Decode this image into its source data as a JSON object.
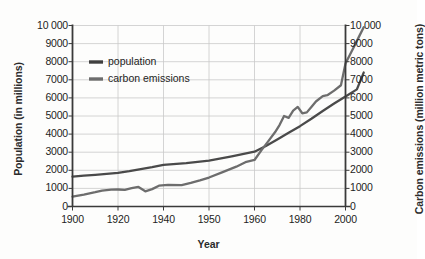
{
  "chart_data": {
    "type": "line",
    "title": "",
    "xlabel": "Year",
    "ylabel": "Population (in millions)",
    "ylabel_right": "Carbon emissions (million metric tons)",
    "xlim": [
      1900,
      2008
    ],
    "ylim": [
      0,
      10000
    ],
    "ylim_right": [
      0,
      10000
    ],
    "grid": true,
    "legend_position": "upper-left-inside",
    "y_ticks": [
      "0",
      "1000",
      "2000",
      "3000",
      "4000",
      "5000",
      "6000",
      "7000",
      "8000",
      "9000",
      "10 000"
    ],
    "y_tick_values": [
      0,
      1000,
      2000,
      3000,
      4000,
      5000,
      6000,
      7000,
      8000,
      9000,
      10000
    ],
    "y_ticks_right": [
      "0",
      "1000",
      "2000",
      "3000",
      "4000",
      "5000",
      "6000",
      "7000",
      "8000",
      "9000",
      "10 000"
    ],
    "x_ticks": [
      "1900",
      "1920",
      "1940",
      "1950",
      "1960",
      "1980",
      "2000"
    ],
    "x_tick_values": [
      1900,
      1920,
      1940,
      1950,
      1960,
      1980,
      2000
    ],
    "series": [
      {
        "name": "population",
        "axis": "left",
        "color": "#4a4a4a",
        "x": [
          1900,
          1905,
          1910,
          1915,
          1920,
          1925,
          1930,
          1935,
          1940,
          1945,
          1950,
          1955,
          1960,
          1965,
          1970,
          1975,
          1980,
          1985,
          1990,
          1995,
          2000,
          2005,
          2008
        ],
        "values": [
          1650,
          1710,
          1750,
          1800,
          1860,
          1950,
          2070,
          2170,
          2300,
          2400,
          2530,
          2770,
          3030,
          3340,
          3700,
          4070,
          4440,
          4850,
          5280,
          5690,
          6080,
          6470,
          7400
        ]
      },
      {
        "name": "carbon emissions",
        "axis": "right",
        "color": "#6d6d6d",
        "x": [
          1900,
          1905,
          1910,
          1913,
          1917,
          1920,
          1923,
          1926,
          1929,
          1932,
          1935,
          1938,
          1941,
          1944,
          1946,
          1948,
          1950,
          1953,
          1956,
          1958,
          1960,
          1963,
          1966,
          1969,
          1971,
          1973,
          1975,
          1977,
          1979,
          1981,
          1983,
          1985,
          1987,
          1990,
          1992,
          1995,
          1998,
          2000,
          2002,
          2004,
          2006,
          2008
        ],
        "values": [
          550,
          660,
          790,
          880,
          930,
          940,
          920,
          1010,
          1080,
          840,
          960,
          1150,
          1200,
          1180,
          1300,
          1440,
          1600,
          1900,
          2200,
          2450,
          2570,
          3100,
          3600,
          4100,
          4500,
          5000,
          4900,
          5300,
          5500,
          5150,
          5200,
          5500,
          5800,
          6100,
          6150,
          6400,
          6700,
          7900,
          8400,
          8900,
          9400,
          9900
        ]
      }
    ]
  },
  "legend": {
    "items": [
      {
        "label": "population",
        "color": "#3f3f3f"
      },
      {
        "label": "carbon emissions",
        "color": "#6d6d6d"
      }
    ]
  },
  "axes": {
    "left_title": "Population (in millions)",
    "right_title": "Carbon emissions (million metric tons)",
    "bottom_title": "Year"
  }
}
